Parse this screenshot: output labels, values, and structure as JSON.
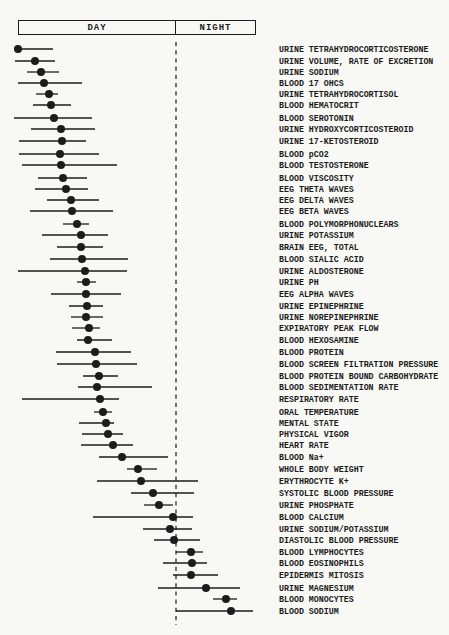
{
  "figure": {
    "paper_color": "#f8f8f5",
    "ink_color": "#1c1c1c"
  },
  "header": {
    "day_label": "DAY",
    "night_label": "NIGHT"
  },
  "chart_data": {
    "type": "scatter",
    "subtype": "acrophase dot plot with horizontal range bars",
    "title": "",
    "xlabel": "",
    "ylabel": "",
    "legend": [],
    "grid": false,
    "x_axis": {
      "kind": "time of day (no numeric ticks shown)",
      "sections": [
        "DAY",
        "NIGHT"
      ],
      "units": "screenshot px on 449-wide canvas",
      "plot_x_range": [
        10,
        257
      ],
      "day_night_divider_x": 176
    },
    "layout": {
      "canvas_w": 449,
      "canvas_h": 635,
      "header_box": {
        "x": 18,
        "y": 20,
        "w": 239,
        "h": 16
      },
      "divider_x": 176,
      "divider_y1": 42,
      "divider_y2": 625,
      "label_x": 279,
      "dot_radius": 4,
      "bar_stroke": 1.3
    },
    "rows": [
      {
        "label": "URINE TETRAHYDROCORTICOSTERONE",
        "lo": 14,
        "x": 18,
        "hi": 53,
        "y": 49
      },
      {
        "label": "URINE VOLUME, RATE OF EXCRETION",
        "lo": 15,
        "x": 35,
        "hi": 55,
        "y": 61
      },
      {
        "label": "URINE SODIUM",
        "lo": 27,
        "x": 41,
        "hi": 59,
        "y": 72
      },
      {
        "label": "BLOOD 17 OHCS",
        "lo": 18,
        "x": 44,
        "hi": 82,
        "y": 83
      },
      {
        "label": "URINE TETRAHYDROCORTISOL",
        "lo": 36,
        "x": 49,
        "hi": 58,
        "y": 94
      },
      {
        "label": "BLOOD HEMATOCRIT",
        "lo": 33,
        "x": 51,
        "hi": 71,
        "y": 105
      },
      {
        "label": "BLOOD SEROTONIN",
        "lo": 14,
        "x": 54,
        "hi": 92,
        "y": 118
      },
      {
        "label": "URINE HYDROXYCORTICOSTEROID",
        "lo": 31,
        "x": 61,
        "hi": 95,
        "y": 129
      },
      {
        "label": "URINE 17-KETOSTEROID",
        "lo": 19,
        "x": 62,
        "hi": 86,
        "y": 141
      },
      {
        "label": "BLOOD pCO2",
        "lo": 19,
        "x": 60,
        "hi": 99,
        "y": 154
      },
      {
        "label": "BLOOD TESTOSTERONE",
        "lo": 22,
        "x": 61,
        "hi": 117,
        "y": 165
      },
      {
        "label": "BLOOD VISCOSITY",
        "lo": 38,
        "x": 63,
        "hi": 87,
        "y": 178
      },
      {
        "label": "EEG THETA WAVES",
        "lo": 35,
        "x": 66,
        "hi": 88,
        "y": 189
      },
      {
        "label": "EEG DELTA WAVES",
        "lo": 47,
        "x": 71,
        "hi": 99,
        "y": 200
      },
      {
        "label": "EEG BETA WAVES",
        "lo": 30,
        "x": 72,
        "hi": 113,
        "y": 211
      },
      {
        "label": "BLOOD POLYMORPHONUCLEARS",
        "lo": 63,
        "x": 77,
        "hi": 89,
        "y": 224
      },
      {
        "label": "URINE POTASSIUM",
        "lo": 42,
        "x": 81,
        "hi": 108,
        "y": 235
      },
      {
        "label": "BRAIN EEG, TOTAL",
        "lo": 57,
        "x": 81,
        "hi": 103,
        "y": 247
      },
      {
        "label": "BLOOD SIALIC ACID",
        "lo": 50,
        "x": 82,
        "hi": 128,
        "y": 259
      },
      {
        "label": "URINE ALDOSTERONE",
        "lo": 18,
        "x": 85,
        "hi": 127,
        "y": 271
      },
      {
        "label": "URINE PH",
        "lo": 77,
        "x": 86,
        "hi": 96,
        "y": 282
      },
      {
        "label": "EEG ALPHA WAVES",
        "lo": 51,
        "x": 86,
        "hi": 121,
        "y": 294
      },
      {
        "label": "URINE EPINEPHRINE",
        "lo": 69,
        "x": 87,
        "hi": 103,
        "y": 306
      },
      {
        "label": "URINE NOREPINEPHRINE",
        "lo": 71,
        "x": 86,
        "hi": 103,
        "y": 317
      },
      {
        "label": "EXPIRATORY PEAK FLOW",
        "lo": 72,
        "x": 89,
        "hi": 100,
        "y": 328
      },
      {
        "label": "BLOOD HEXOSAMINE",
        "lo": 77,
        "x": 88,
        "hi": 112,
        "y": 340
      },
      {
        "label": "BLOOD PROTEIN",
        "lo": 56,
        "x": 95,
        "hi": 131,
        "y": 352
      },
      {
        "label": "BLOOD SCREEN FILTRATION PRESSURE",
        "lo": 57,
        "x": 96,
        "hi": 137,
        "y": 364
      },
      {
        "label": "BLOOD PROTEIN BOUND CARBOHYDRATE",
        "lo": 83,
        "x": 99,
        "hi": 118,
        "y": 376
      },
      {
        "label": "BLOOD SEDIMENTATION RATE",
        "lo": 78,
        "x": 97,
        "hi": 152,
        "y": 387
      },
      {
        "label": "RESPIRATORY RATE",
        "lo": 22,
        "x": 100,
        "hi": 119,
        "y": 399
      },
      {
        "label": "ORAL TEMPERATURE",
        "lo": 94,
        "x": 103,
        "hi": 112,
        "y": 412
      },
      {
        "label": "MENTAL STATE",
        "lo": 79,
        "x": 106,
        "hi": 114,
        "y": 423
      },
      {
        "label": "PHYSICAL VIGOR",
        "lo": 82,
        "x": 108,
        "hi": 123,
        "y": 434
      },
      {
        "label": "HEART RATE",
        "lo": 81,
        "x": 113,
        "hi": 133,
        "y": 445
      },
      {
        "label": "BLOOD Na+",
        "lo": 99,
        "x": 122,
        "hi": 168,
        "y": 457
      },
      {
        "label": "WHOLE BODY WEIGHT",
        "lo": 127,
        "x": 138,
        "hi": 157,
        "y": 469
      },
      {
        "label": "ERYTHROCYTE K+",
        "lo": 97,
        "x": 141,
        "hi": 198,
        "y": 481
      },
      {
        "label": "SYSTOLIC BLOOD PRESSURE",
        "lo": 131,
        "x": 153,
        "hi": 194,
        "y": 493
      },
      {
        "label": "URINE PHOSPHATE",
        "lo": 144,
        "x": 159,
        "hi": 173,
        "y": 505
      },
      {
        "label": "BLOOD CALCIUM",
        "lo": 93,
        "x": 173,
        "hi": 193,
        "y": 517
      },
      {
        "label": "URINE SODIUM/POTASSIUM",
        "lo": 143,
        "x": 170,
        "hi": 192,
        "y": 529
      },
      {
        "label": "DIASTOLIC BLOOD PRESSURE",
        "lo": 154,
        "x": 174,
        "hi": 200,
        "y": 540
      },
      {
        "label": "BLOOD LYMPHOCYTES",
        "lo": 176,
        "x": 191,
        "hi": 203,
        "y": 552
      },
      {
        "label": "BLOOD EOSINOPHILS",
        "lo": 163,
        "x": 192,
        "hi": 207,
        "y": 563
      },
      {
        "label": "EPIDERMIS MITOSIS",
        "lo": 173,
        "x": 191,
        "hi": 218,
        "y": 575
      },
      {
        "label": "URINE MAGNESIUM",
        "lo": 158,
        "x": 206,
        "hi": 240,
        "y": 588
      },
      {
        "label": "BLOOD MONOCYTES",
        "lo": 213,
        "x": 226,
        "hi": 237,
        "y": 599
      },
      {
        "label": "BLOOD SODIUM",
        "lo": 176,
        "x": 231,
        "hi": 253,
        "y": 611
      }
    ]
  }
}
